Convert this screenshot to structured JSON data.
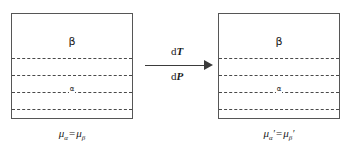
{
  "diagram": {
    "colors": {
      "background": "#ffffff",
      "box_border": "#565656",
      "dash_line": "#4a4a4a",
      "arrow": "#3b3b3b",
      "text": "#1a1a1a"
    },
    "left_system": {
      "name": "initial-state",
      "upper_phase_label": "β",
      "lower_phase_label": "α",
      "dashed_line_count": 4,
      "caption": {
        "mu": "μ",
        "sub_alpha": "α",
        "equals": "=",
        "sub_beta": "β",
        "prime": "",
        "full": "μα = μβ"
      }
    },
    "right_system": {
      "name": "final-state",
      "upper_phase_label": "β",
      "lower_phase_label": "α",
      "dashed_line_count": 4,
      "caption": {
        "mu": "μ",
        "sub_alpha": "α",
        "equals": "=",
        "sub_beta": "β",
        "prime": "′",
        "full": "μα′ = μβ′"
      }
    },
    "transition": {
      "arrow_direction": "right",
      "label_above_d": "d",
      "label_above_var": "T",
      "label_below_d": "d",
      "label_below_var": "P",
      "label_above": "dT",
      "label_below": "dP"
    }
  }
}
